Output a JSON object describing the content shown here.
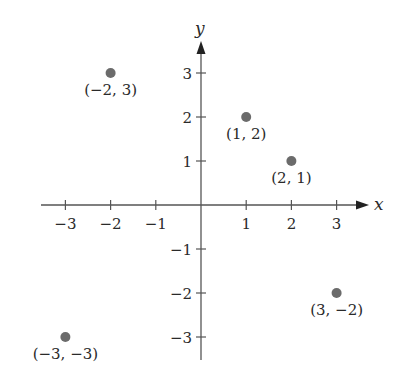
{
  "chart_data": {
    "type": "scatter",
    "title": "",
    "xlabel": "x",
    "ylabel": "y",
    "xlim": [
      -3.5,
      3.7
    ],
    "ylim": [
      -3.5,
      3.7
    ],
    "grid": false,
    "legend": null,
    "x_ticks": [
      -3,
      -2,
      -1,
      1,
      2,
      3
    ],
    "y_ticks": [
      -3,
      -2,
      -1,
      1,
      2,
      3
    ],
    "x_tick_labels": [
      "−3",
      "−2",
      "−1",
      "1",
      "2",
      "3"
    ],
    "y_tick_labels": [
      "−3",
      "−2",
      "−1",
      "1",
      "2",
      "3"
    ],
    "points": [
      {
        "x": -2,
        "y": 3,
        "label": "(−2, 3)"
      },
      {
        "x": 1,
        "y": 2,
        "label": "(1, 2)"
      },
      {
        "x": 2,
        "y": 1,
        "label": "(2, 1)"
      },
      {
        "x": 3,
        "y": -2,
        "label": "(3, −2)"
      },
      {
        "x": -3,
        "y": -3,
        "label": "(−3, −3)"
      }
    ],
    "colors": {
      "point": "#6b6b6b",
      "axis": "#555555",
      "text": "#2a2a2a"
    }
  }
}
